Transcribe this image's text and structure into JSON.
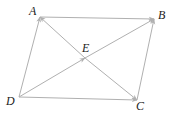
{
  "diagram": {
    "type": "parallelogram-with-vector-diagonals",
    "line_color": "#b0b0b0",
    "label_color": "#222222",
    "points": {
      "A": {
        "label": "A",
        "x": 40,
        "y": 17
      },
      "B": {
        "label": "B",
        "x": 154,
        "y": 19
      },
      "C": {
        "label": "C",
        "x": 137,
        "y": 100
      },
      "D": {
        "label": "D",
        "x": 19,
        "y": 97
      },
      "E": {
        "label": "E",
        "x": 85,
        "y": 58
      }
    },
    "vectors": [
      {
        "from": "A",
        "to": "B"
      },
      {
        "from": "D",
        "to": "C"
      },
      {
        "from": "D",
        "to": "A"
      },
      {
        "from": "C",
        "to": "B"
      },
      {
        "from": "D",
        "to": "E"
      },
      {
        "from": "E",
        "to": "B"
      },
      {
        "from": "E",
        "to": "A"
      },
      {
        "from": "E",
        "to": "C"
      }
    ]
  }
}
